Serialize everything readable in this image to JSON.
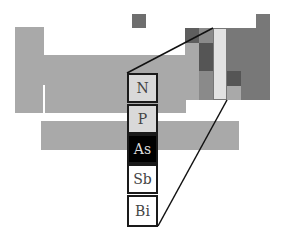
{
  "diagram": {
    "colors": {
      "table_block": "#a9a9a9",
      "p_block": "#777777",
      "dark_block": "#555555",
      "highlight_column": "#e2e2e2",
      "light_cell": "#d9d9d9",
      "selected_cell": "#000000",
      "white_cell": "#ffffff"
    },
    "group_elements": [
      {
        "symbol": "N",
        "state": "light"
      },
      {
        "symbol": "P",
        "state": "light"
      },
      {
        "symbol": "As",
        "state": "selected"
      },
      {
        "symbol": "Sb",
        "state": "white"
      },
      {
        "symbol": "Bi",
        "state": "white"
      }
    ]
  }
}
